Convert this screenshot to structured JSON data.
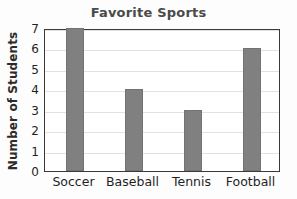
{
  "chart_data": {
    "type": "bar",
    "title": "Favorite Sports",
    "xlabel": "",
    "ylabel": "Number of Students",
    "categories": [
      "Soccer",
      "Baseball",
      "Tennis",
      "Football"
    ],
    "values": [
      7,
      4,
      3,
      6
    ],
    "ylim": [
      0,
      7
    ],
    "yticks": [
      0,
      1,
      2,
      3,
      4,
      5,
      6,
      7
    ],
    "ytick_labels": [
      "0",
      "1",
      "2",
      "3",
      "4",
      "5",
      "6",
      "7"
    ],
    "grid": true,
    "grid_axis": "y",
    "legend": false,
    "legend_position": "none",
    "bar_color": "#808080",
    "title_color": "#4a4a4a",
    "axis_color": "#3a3a3a",
    "grid_color": "#e2e2e2",
    "background_color": "#ffffff"
  }
}
